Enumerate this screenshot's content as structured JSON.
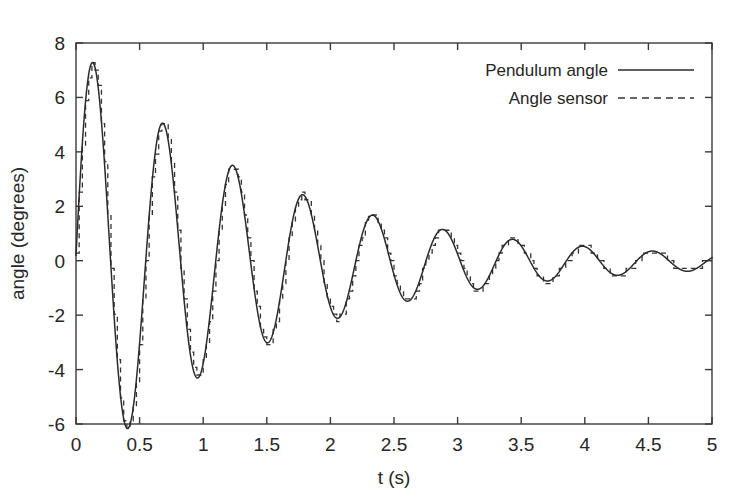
{
  "chart_data": {
    "type": "line",
    "title": "",
    "subtitle": "",
    "xlabel": "t (s)",
    "ylabel": "angle (degrees)",
    "xlim": [
      0,
      5
    ],
    "ylim": [
      -6,
      8
    ],
    "xticks": [
      0,
      0.5,
      1,
      1.5,
      2,
      2.5,
      3,
      3.5,
      4,
      4.5,
      5
    ],
    "xtick_labels": [
      "0",
      "0.5",
      "1",
      "1.5",
      "2",
      "2.5",
      "3",
      "3.5",
      "4",
      "4.5",
      "5"
    ],
    "yticks": [
      -6,
      -4,
      -2,
      0,
      2,
      4,
      6,
      8
    ],
    "ytick_labels": [
      "-6",
      "-4",
      "-2",
      "0",
      "2",
      "4",
      "6",
      "8"
    ],
    "grid": false,
    "legend_position": "top-right",
    "legend": [
      {
        "name": "Pendulum angle",
        "style": "solid",
        "color": "#2b2b2b"
      },
      {
        "name": "Angle sensor",
        "style": "dashed",
        "color": "#333333"
      }
    ],
    "model": {
      "description": "damped sinusoidal pendulum response; sensor trace is a quantized sample-and-hold of the true angle",
      "amplitude_deg": 8.0,
      "decay_time_constant_s": 1.52,
      "angular_frequency_rad_s": 11.42,
      "phase_rad": 0.03,
      "offset_deg": -0.05,
      "sensor_sample_period_s": 0.025,
      "sensor_quantization_step_deg": 0.28
    },
    "series": [
      {
        "name": "Pendulum angle",
        "style": "solid",
        "extrema": [
          {
            "t": 0.19,
            "angle": 7.52,
            "kind": "peak"
          },
          {
            "t": 0.46,
            "angle": -4.85,
            "kind": "trough"
          },
          {
            "t": 0.74,
            "angle": 3.05,
            "kind": "peak"
          },
          {
            "t": 1.01,
            "angle": -2.48,
            "kind": "trough"
          },
          {
            "t": 1.29,
            "angle": 1.78,
            "kind": "peak"
          },
          {
            "t": 1.56,
            "angle": -1.72,
            "kind": "trough"
          },
          {
            "t": 1.84,
            "angle": 1.32,
            "kind": "peak"
          },
          {
            "t": 2.11,
            "angle": -1.6,
            "kind": "trough"
          },
          {
            "t": 2.39,
            "angle": 1.22,
            "kind": "peak"
          },
          {
            "t": 2.66,
            "angle": -1.44,
            "kind": "trough"
          },
          {
            "t": 2.94,
            "angle": 1.18,
            "kind": "peak"
          },
          {
            "t": 3.21,
            "angle": -1.42,
            "kind": "trough"
          },
          {
            "t": 3.49,
            "angle": 1.28,
            "kind": "peak"
          },
          {
            "t": 3.76,
            "angle": -1.36,
            "kind": "trough"
          },
          {
            "t": 4.04,
            "angle": 1.24,
            "kind": "peak"
          },
          {
            "t": 4.31,
            "angle": -1.4,
            "kind": "trough"
          },
          {
            "t": 4.59,
            "angle": 1.3,
            "kind": "peak"
          },
          {
            "t": 4.86,
            "angle": -1.38,
            "kind": "trough"
          },
          {
            "t": 5.0,
            "angle": 1.2,
            "kind": "endpoint"
          }
        ]
      },
      {
        "name": "Angle sensor",
        "style": "dashed",
        "extrema": [
          {
            "t": 0.19,
            "angle": 7.4,
            "kind": "peak"
          },
          {
            "t": 0.46,
            "angle": -4.76,
            "kind": "trough"
          },
          {
            "t": 0.74,
            "angle": 2.8,
            "kind": "peak"
          },
          {
            "t": 1.01,
            "angle": -2.38,
            "kind": "trough"
          },
          {
            "t": 1.29,
            "angle": 1.55,
            "kind": "peak"
          },
          {
            "t": 1.56,
            "angle": -1.4,
            "kind": "trough"
          },
          {
            "t": 1.84,
            "angle": 1.12,
            "kind": "peak"
          },
          {
            "t": 2.11,
            "angle": -1.4,
            "kind": "trough"
          },
          {
            "t": 2.39,
            "angle": 1.12,
            "kind": "peak"
          },
          {
            "t": 2.66,
            "angle": -1.12,
            "kind": "trough"
          },
          {
            "t": 2.94,
            "angle": 1.12,
            "kind": "peak"
          },
          {
            "t": 3.21,
            "angle": -1.12,
            "kind": "trough"
          },
          {
            "t": 3.49,
            "angle": 1.12,
            "kind": "peak"
          },
          {
            "t": 3.76,
            "angle": -1.12,
            "kind": "trough"
          },
          {
            "t": 4.04,
            "angle": 1.12,
            "kind": "peak"
          },
          {
            "t": 4.31,
            "angle": -1.12,
            "kind": "trough"
          },
          {
            "t": 4.59,
            "angle": 1.12,
            "kind": "peak"
          },
          {
            "t": 4.86,
            "angle": -1.12,
            "kind": "trough"
          },
          {
            "t": 5.0,
            "angle": 1.12,
            "kind": "endpoint"
          }
        ]
      }
    ]
  },
  "plot_geometry": {
    "left": 76,
    "top": 43,
    "right": 712,
    "bottom": 424
  }
}
